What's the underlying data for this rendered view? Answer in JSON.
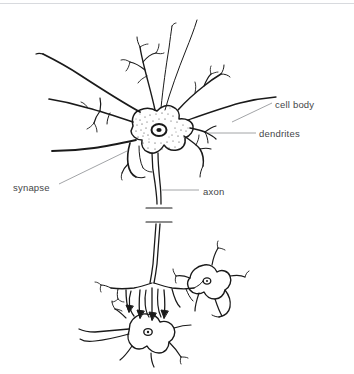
{
  "figure": {
    "background_color": "#ffffff",
    "ink_color": "#1a1a1a",
    "leader_line_color": "#8a8d90",
    "label_text_color": "#444648",
    "top_rule_color": "#d8dade",
    "width": 354,
    "height": 374
  },
  "labels": [
    {
      "id": "cell-body",
      "text": "cell body",
      "leader": {
        "x1": 272,
        "y1": 103,
        "x2": 232,
        "y2": 123
      }
    },
    {
      "id": "dendrites",
      "text": "dendrites",
      "leader": {
        "x1": 256,
        "y1": 133,
        "x2": 208,
        "y2": 133
      }
    },
    {
      "id": "synapse",
      "text": "synapse",
      "leader": {
        "x1": 58,
        "y1": 185,
        "x2": 126,
        "y2": 152
      }
    },
    {
      "id": "axon",
      "text": "axon",
      "leader": {
        "x1": 200,
        "y1": 190,
        "x2": 162,
        "y2": 190
      }
    }
  ],
  "anatomy": {
    "parts": [
      "dendrites",
      "cell body",
      "nucleus",
      "axon",
      "axon break marks",
      "axon terminals",
      "synapse",
      "target neurons"
    ],
    "target_neuron_count": 2
  }
}
